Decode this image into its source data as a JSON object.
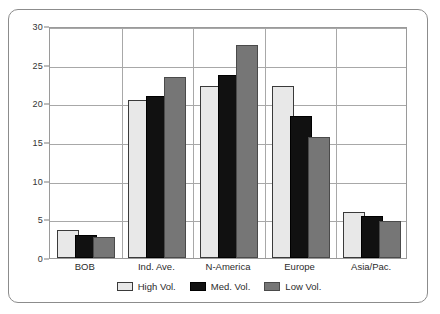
{
  "chart_data": {
    "type": "bar",
    "title": "",
    "xlabel": "",
    "ylabel": "",
    "ylim": [
      0,
      30
    ],
    "ytick_step": 5,
    "ytick_labels": [
      "0",
      "5",
      "10",
      "15",
      "20",
      "25",
      "30"
    ],
    "grid": true,
    "legend_position": "bottom-center",
    "categories": [
      "BOB",
      "Ind. Ave.",
      "N-America",
      "Europe",
      "Asia/Pac."
    ],
    "series": [
      {
        "name": "High Vol.",
        "color": "#e8e8e8",
        "values": [
          3.6,
          20.4,
          22.3,
          22.2,
          5.9
        ]
      },
      {
        "name": "Med. Vol.",
        "color": "#111111",
        "values": [
          3.0,
          21.0,
          23.7,
          18.4,
          5.4
        ]
      },
      {
        "name": "Low Vol.",
        "color": "#767676",
        "values": [
          2.7,
          23.4,
          27.5,
          15.6,
          4.8
        ]
      }
    ]
  },
  "legend": {
    "items": [
      {
        "label": "High Vol."
      },
      {
        "label": "Med. Vol."
      },
      {
        "label": "Low Vol."
      }
    ]
  }
}
